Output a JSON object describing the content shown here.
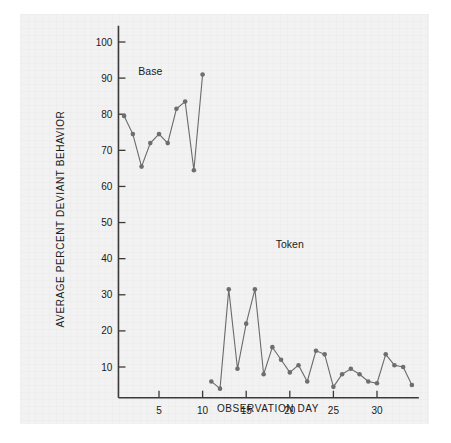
{
  "figure": {
    "background_color": "#ffffff",
    "panel_color": "#f2f2f2",
    "line_color": "#6b6b6b",
    "marker_color": "#6e6e6e",
    "axis_color": "#3a3a3a"
  },
  "labels": {
    "base_phase": "Base",
    "token_phase": "Token",
    "y_axis_title": "AVERAGE PERCENT DEVIANT BEHAVIOR",
    "x_axis_title": "OBSERVATION DAY"
  },
  "chart_data": {
    "type": "line",
    "title": "",
    "xlabel": "OBSERVATION DAY",
    "ylabel": "AVERAGE PERCENT DEVIANT BEHAVIOR",
    "xlim": [
      0,
      35
    ],
    "ylim": [
      0,
      105
    ],
    "xticks": [
      5,
      10,
      15,
      20,
      25,
      30
    ],
    "yticks": [
      10,
      20,
      30,
      40,
      50,
      60,
      70,
      80,
      90,
      100
    ],
    "xticklabels": [
      "5",
      "10",
      "15",
      "20",
      "25",
      "30"
    ],
    "yticklabels": [
      "10",
      "20",
      "30",
      "40",
      "50",
      "60",
      "70",
      "80",
      "90",
      "100"
    ],
    "grid": false,
    "legend": "none",
    "annotations": [
      {
        "text": "Base",
        "x": 4,
        "y": 91
      },
      {
        "text": "Token",
        "x": 20,
        "y": 43
      }
    ],
    "series": [
      {
        "name": "Base",
        "x": [
          1,
          2,
          3,
          4,
          5,
          6,
          7,
          8,
          9,
          10
        ],
        "values": [
          79.5,
          74.5,
          65.5,
          72.0,
          74.5,
          72.0,
          81.5,
          83.5,
          64.5,
          91.0
        ]
      },
      {
        "name": "Token",
        "x": [
          11,
          12,
          13,
          14,
          15,
          16,
          17,
          18,
          19,
          20,
          21,
          22,
          23,
          24,
          25,
          26,
          27,
          28,
          29,
          30,
          31,
          32,
          33,
          34
        ],
        "values": [
          6.0,
          4.0,
          31.5,
          9.5,
          22.0,
          31.5,
          8.0,
          15.5,
          12.0,
          8.5,
          10.5,
          6.0,
          14.5,
          13.5,
          4.5,
          8.0,
          9.5,
          8.0,
          6.0,
          5.5,
          13.5,
          10.5,
          10.0,
          5.0
        ]
      }
    ]
  }
}
